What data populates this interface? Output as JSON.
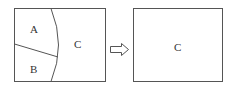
{
  "diagram": {
    "left_panel": {
      "regions": [
        "A",
        "B",
        "C"
      ]
    },
    "arrow": {
      "direction": "right"
    },
    "right_panel": {
      "regions": [
        "C"
      ]
    }
  },
  "labels": {
    "a": "A",
    "b": "B",
    "c_left": "C",
    "c_right": "C"
  },
  "colors": {
    "stroke": "#555555",
    "background": "#ffffff"
  }
}
